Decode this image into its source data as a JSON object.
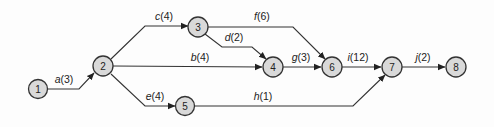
{
  "diagram": {
    "type": "activity-on-arrow network",
    "nodes": [
      {
        "id": "1",
        "label": "1",
        "x": 38,
        "y": 88
      },
      {
        "id": "2",
        "label": "2",
        "x": 103,
        "y": 66
      },
      {
        "id": "3",
        "label": "3",
        "x": 198,
        "y": 27
      },
      {
        "id": "4",
        "label": "4",
        "x": 273,
        "y": 67
      },
      {
        "id": "5",
        "label": "5",
        "x": 185,
        "y": 106
      },
      {
        "id": "6",
        "label": "6",
        "x": 332,
        "y": 67
      },
      {
        "id": "7",
        "label": "7",
        "x": 392,
        "y": 67
      },
      {
        "id": "8",
        "label": "8",
        "x": 456,
        "y": 67
      }
    ],
    "edges": [
      {
        "from": "1",
        "to": "2",
        "activity": "a",
        "duration": "(3)"
      },
      {
        "from": "2",
        "to": "3",
        "activity": "c",
        "duration": "(4)"
      },
      {
        "from": "2",
        "to": "4",
        "activity": "b",
        "duration": "(4)"
      },
      {
        "from": "2",
        "to": "5",
        "activity": "e",
        "duration": "(4)"
      },
      {
        "from": "3",
        "to": "4",
        "activity": "d",
        "duration": "(2)"
      },
      {
        "from": "3",
        "to": "6",
        "activity": "f",
        "duration": "(6)"
      },
      {
        "from": "4",
        "to": "6",
        "activity": "g",
        "duration": "(3)"
      },
      {
        "from": "5",
        "to": "7",
        "activity": "h",
        "duration": "(1)"
      },
      {
        "from": "6",
        "to": "7",
        "activity": "i",
        "duration": "(12)"
      },
      {
        "from": "7",
        "to": "8",
        "activity": "j",
        "duration": "(2)"
      }
    ]
  },
  "colors": {
    "node_fill": "#d9d9d9",
    "stroke": "#333333"
  }
}
